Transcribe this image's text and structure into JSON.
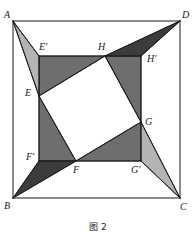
{
  "figure": {
    "caption": "图 2",
    "background_color": "#ffffff",
    "line_color": "#1a1a1a",
    "colors": {
      "outline": "#1a1a1a",
      "band_gray": "#6e6e6e",
      "dark_gray": "#3c3c3c",
      "light_gray": "#b4b4b4",
      "white": "#ffffff"
    },
    "outer_square": {
      "name": "ABCD",
      "vertices": [
        {
          "label": "A",
          "x": 13,
          "y": 21
        },
        {
          "label": "D",
          "x": 180,
          "y": 21
        },
        {
          "label": "C",
          "x": 180,
          "y": 198
        },
        {
          "label": "B",
          "x": 13,
          "y": 198
        }
      ]
    },
    "middle_square": {
      "name": "E'H'G'F'",
      "vertices": [
        {
          "label": "E'",
          "x": 39,
          "y": 56
        },
        {
          "label": "H'",
          "x": 141,
          "y": 56
        },
        {
          "label": "G'",
          "x": 141,
          "y": 161
        },
        {
          "label": "F'",
          "x": 39,
          "y": 161
        }
      ]
    },
    "inner_square": {
      "name": "EHGF",
      "vertices": [
        {
          "label": "E",
          "x": 39,
          "y": 96
        },
        {
          "label": "H",
          "x": 105,
          "y": 56
        },
        {
          "label": "G",
          "x": 141,
          "y": 122
        },
        {
          "label": "F",
          "x": 76,
          "y": 161
        }
      ]
    },
    "labels": [
      {
        "id": "label-A",
        "text": "A",
        "x": 4,
        "y": 10
      },
      {
        "id": "label-D",
        "text": "D",
        "x": 182,
        "y": 10
      },
      {
        "id": "label-B",
        "text": "B",
        "x": 4,
        "y": 201
      },
      {
        "id": "label-C",
        "text": "C",
        "x": 180,
        "y": 202
      },
      {
        "id": "label-E-prime",
        "text": "E'",
        "x": 39,
        "y": 42
      },
      {
        "id": "label-H",
        "text": "H",
        "x": 98,
        "y": 42
      },
      {
        "id": "label-H-prime",
        "text": "H'",
        "x": 147,
        "y": 54
      },
      {
        "id": "label-E",
        "text": "E",
        "x": 25,
        "y": 88
      },
      {
        "id": "label-G",
        "text": "G",
        "x": 145,
        "y": 117
      },
      {
        "id": "label-F-prime",
        "text": "F'",
        "x": 26,
        "y": 152
      },
      {
        "id": "label-F",
        "text": "F",
        "x": 73,
        "y": 165
      },
      {
        "id": "label-G-prime",
        "text": "G'",
        "x": 131,
        "y": 165
      }
    ],
    "regions": [
      {
        "id": "wing-A",
        "name": "light-wing-top-left",
        "fill": "#b4b4b4",
        "points": "13,21 39,56 39,96"
      },
      {
        "id": "wing-C",
        "name": "light-wing-bottom-right",
        "fill": "#b4b4b4",
        "points": "180,198 141,161 141,122"
      },
      {
        "id": "spike-B",
        "name": "dark-spike-bottom-left",
        "fill": "#3c3c3c",
        "points": "13,198 39,161 76,161"
      },
      {
        "id": "spike-D",
        "name": "dark-spike-top-right",
        "fill": "#3c3c3c",
        "points": "180,21 141,56 105,56"
      },
      {
        "id": "band-left",
        "name": "band-left-trapezoid",
        "fill": "#6e6e6e",
        "points": "39,56 105,56 39,96"
      },
      {
        "id": "band-left-lower",
        "name": "band-left-lower",
        "fill": "#6e6e6e",
        "points": "39,96 76,161 39,161"
      },
      {
        "id": "band-right-upper",
        "name": "band-right-upper",
        "fill": "#6e6e6e",
        "points": "105,56 141,56 141,122"
      },
      {
        "id": "band-right-lower",
        "name": "band-right-lower",
        "fill": "#6e6e6e",
        "points": "141,122 141,161 76,161"
      },
      {
        "id": "inner-white-square",
        "name": "inner-white-square",
        "fill": "#ffffff",
        "points": "39,96 105,56 141,122 76,161"
      }
    ],
    "edges": [
      {
        "id": "edge-AD",
        "from": "A",
        "to": "D",
        "x1": 13,
        "y1": 21,
        "x2": 180,
        "y2": 21
      },
      {
        "id": "edge-DC",
        "from": "D",
        "to": "C",
        "x1": 180,
        "y1": 21,
        "x2": 180,
        "y2": 198
      },
      {
        "id": "edge-CB",
        "from": "C",
        "to": "B",
        "x1": 180,
        "y1": 198,
        "x2": 13,
        "y2": 198
      },
      {
        "id": "edge-BA",
        "from": "B",
        "to": "A",
        "x1": 13,
        "y1": 198,
        "x2": 13,
        "y2": 21
      },
      {
        "id": "edge-EpHp",
        "from": "E'",
        "to": "H'",
        "x1": 39,
        "y1": 56,
        "x2": 141,
        "y2": 56
      },
      {
        "id": "edge-HpGp",
        "from": "H'",
        "to": "G'",
        "x1": 141,
        "y1": 56,
        "x2": 141,
        "y2": 161
      },
      {
        "id": "edge-GpFp",
        "from": "G'",
        "to": "F'",
        "x1": 141,
        "y1": 161,
        "x2": 39,
        "y2": 161
      },
      {
        "id": "edge-FpEp",
        "from": "F'",
        "to": "E'",
        "x1": 39,
        "y1": 161,
        "x2": 39,
        "y2": 56
      },
      {
        "id": "edge-EH",
        "from": "E",
        "to": "H",
        "x1": 39,
        "y1": 96,
        "x2": 105,
        "y2": 56
      },
      {
        "id": "edge-HG",
        "from": "H",
        "to": "G",
        "x1": 105,
        "y1": 56,
        "x2": 141,
        "y2": 122
      },
      {
        "id": "edge-GF",
        "from": "G",
        "to": "F",
        "x1": 141,
        "y1": 122,
        "x2": 76,
        "y2": 161
      },
      {
        "id": "edge-FE",
        "from": "F",
        "to": "E",
        "x1": 76,
        "y1": 161,
        "x2": 39,
        "y2": 96
      },
      {
        "id": "edge-A-Ep",
        "from": "A",
        "to": "E'",
        "x1": 13,
        "y1": 21,
        "x2": 39,
        "y2": 56
      },
      {
        "id": "edge-A-E",
        "from": "A",
        "to": "E",
        "x1": 13,
        "y1": 21,
        "x2": 39,
        "y2": 96
      },
      {
        "id": "edge-D-Hp",
        "from": "D",
        "to": "H'",
        "x1": 180,
        "y1": 21,
        "x2": 141,
        "y2": 56
      },
      {
        "id": "edge-D-H",
        "from": "D",
        "to": "H",
        "x1": 180,
        "y1": 21,
        "x2": 105,
        "y2": 56
      },
      {
        "id": "edge-B-Fp",
        "from": "B",
        "to": "F'",
        "x1": 13,
        "y1": 198,
        "x2": 39,
        "y2": 161
      },
      {
        "id": "edge-B-F",
        "from": "B",
        "to": "F",
        "x1": 13,
        "y1": 198,
        "x2": 76,
        "y2": 161
      },
      {
        "id": "edge-C-Gp",
        "from": "C",
        "to": "G'",
        "x1": 180,
        "y1": 198,
        "x2": 141,
        "y2": 161
      },
      {
        "id": "edge-C-G",
        "from": "C",
        "to": "G",
        "x1": 180,
        "y1": 198,
        "x2": 141,
        "y2": 122
      }
    ]
  }
}
